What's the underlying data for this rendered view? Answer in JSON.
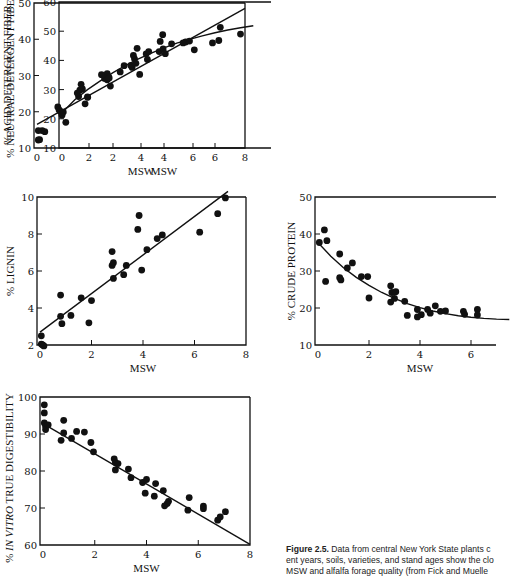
{
  "chart_data": [
    {
      "id": "adf",
      "type": "scatter",
      "title": "",
      "xlabel": "MSW",
      "ylabel": "% ACID DETERGENT FIBER",
      "xlim": [
        0,
        8
      ],
      "ylim": [
        10,
        50
      ],
      "xticks": [
        0,
        2,
        4,
        6,
        8
      ],
      "yticks": [
        10,
        20,
        30,
        40,
        50
      ],
      "fit": {
        "type": "linear",
        "points": [
          [
            0,
            16.5
          ],
          [
            8,
            48.5
          ]
        ]
      },
      "points": [
        [
          0.05,
          12.2
        ],
        [
          0.1,
          12.3
        ],
        [
          0.05,
          14.8
        ],
        [
          0.2,
          14.8
        ],
        [
          0.3,
          14.5
        ],
        [
          0.8,
          21.3
        ],
        [
          0.85,
          20.5
        ],
        [
          0.9,
          20.1
        ],
        [
          1.6,
          24.2
        ],
        [
          1.85,
          22.2
        ],
        [
          1.95,
          24.0
        ],
        [
          2.6,
          29.2
        ],
        [
          2.7,
          30.5
        ],
        [
          2.7,
          28.8
        ],
        [
          2.75,
          29.6
        ],
        [
          3.2,
          31.0
        ],
        [
          3.35,
          32.7
        ],
        [
          3.75,
          34.6
        ],
        [
          3.85,
          37.5
        ],
        [
          3.95,
          30.3
        ],
        [
          4.2,
          36.0
        ],
        [
          4.7,
          36.6
        ],
        [
          4.85,
          37.3
        ],
        [
          6.05,
          37.1
        ],
        [
          6.75,
          39.0
        ],
        [
          7.05,
          43.3
        ]
      ]
    },
    {
      "id": "ndf",
      "type": "scatter",
      "title": "",
      "xlabel": "MSW",
      "ylabel": "% NEUTRAL-DETERGENT FIBER",
      "xlim": [
        0,
        8
      ],
      "ylim": [
        10,
        60
      ],
      "xticks": [
        0,
        2,
        4,
        6
      ],
      "yticks": [
        10,
        20,
        30,
        40,
        50,
        60
      ],
      "fit": {
        "type": "curve",
        "points": [
          [
            0.05,
            22.5
          ],
          [
            0.5,
            26.5
          ],
          [
            1,
            30
          ],
          [
            1.5,
            33
          ],
          [
            2,
            35.8
          ],
          [
            2.5,
            38.3
          ],
          [
            3,
            40.5
          ],
          [
            3.5,
            42.5
          ],
          [
            4,
            44.3
          ],
          [
            4.5,
            45.9
          ],
          [
            5,
            47.2
          ],
          [
            5.5,
            48.4
          ],
          [
            6,
            49.5
          ],
          [
            6.5,
            50.4
          ],
          [
            7,
            51.2
          ],
          [
            7.5,
            51.9
          ]
        ]
      },
      "points": [
        [
          0,
          21.2
        ],
        [
          0.05,
          22.3
        ],
        [
          0.15,
          18.8
        ],
        [
          0.6,
          28.8
        ],
        [
          0.7,
          29.8
        ],
        [
          0.75,
          31.8
        ],
        [
          0.8,
          30.2
        ],
        [
          1.0,
          27.5
        ],
        [
          1.55,
          35.1
        ],
        [
          1.85,
          34.0
        ],
        [
          1.9,
          31.2
        ],
        [
          2.7,
          38.3
        ],
        [
          2.75,
          37.6
        ],
        [
          2.8,
          41.7
        ],
        [
          2.9,
          39.0
        ],
        [
          3.35,
          40.3
        ],
        [
          3.4,
          43.0
        ],
        [
          3.85,
          46.5
        ],
        [
          3.95,
          48.8
        ],
        [
          4.05,
          42.3
        ],
        [
          4.3,
          45.7
        ],
        [
          4.75,
          46.0
        ],
        [
          4.85,
          46.3
        ],
        [
          5.0,
          46.6
        ],
        [
          6.15,
          46.8
        ],
        [
          7.0,
          49.0
        ]
      ]
    },
    {
      "id": "lignin",
      "type": "scatter",
      "title": "",
      "xlabel": "MSW",
      "ylabel": "% LIGNIN",
      "xlim": [
        0,
        8
      ],
      "ylim": [
        2,
        10
      ],
      "xticks": [
        0,
        2,
        4,
        6,
        8
      ],
      "yticks": [
        2,
        4,
        6,
        8,
        10
      ],
      "fit": {
        "type": "linear",
        "points": [
          [
            0,
            2.7
          ],
          [
            7.3,
            10.3
          ]
        ]
      },
      "points": [
        [
          0.05,
          2.5
        ],
        [
          0.05,
          2.05
        ],
        [
          0.1,
          2.0
        ],
        [
          0.15,
          1.95
        ],
        [
          0.8,
          4.7
        ],
        [
          0.8,
          3.55
        ],
        [
          0.85,
          3.15
        ],
        [
          1.2,
          3.6
        ],
        [
          1.6,
          4.55
        ],
        [
          1.9,
          3.2
        ],
        [
          2.0,
          4.4
        ],
        [
          2.8,
          7.05
        ],
        [
          2.8,
          6.3
        ],
        [
          2.85,
          6.45
        ],
        [
          2.85,
          5.6
        ],
        [
          3.25,
          5.8
        ],
        [
          3.35,
          6.3
        ],
        [
          3.8,
          8.25
        ],
        [
          3.85,
          9.0
        ],
        [
          3.95,
          6.05
        ],
        [
          4.15,
          7.15
        ],
        [
          4.55,
          7.75
        ],
        [
          4.75,
          7.95
        ],
        [
          6.2,
          8.1
        ],
        [
          6.9,
          9.1
        ],
        [
          7.2,
          9.95
        ]
      ]
    },
    {
      "id": "cp",
      "type": "scatter",
      "title": "",
      "xlabel": "MSW",
      "ylabel": "% CRUDE PROTEIN",
      "xlim": [
        0,
        8
      ],
      "ylim": [
        10,
        50
      ],
      "xticks": [
        0,
        2,
        4,
        6
      ],
      "yticks": [
        10,
        20,
        30,
        40,
        50
      ],
      "fit": {
        "type": "curve",
        "points": [
          [
            0.05,
            37.3
          ],
          [
            0.5,
            34.0
          ],
          [
            1,
            30.9
          ],
          [
            1.5,
            28.3
          ],
          [
            2,
            26.1
          ],
          [
            2.5,
            24.2
          ],
          [
            3,
            22.6
          ],
          [
            3.5,
            21.2
          ],
          [
            4,
            20.1
          ],
          [
            4.5,
            19.2
          ],
          [
            5,
            18.5
          ],
          [
            5.5,
            17.9
          ],
          [
            6,
            17.5
          ],
          [
            6.5,
            17.2
          ],
          [
            7,
            17.0
          ],
          [
            7.5,
            16.9
          ]
        ]
      },
      "points": [
        [
          0.05,
          37.7
        ],
        [
          0.25,
          41.1
        ],
        [
          0.35,
          38.2
        ],
        [
          0.3,
          27.2
        ],
        [
          0.85,
          34.6
        ],
        [
          0.85,
          28.2
        ],
        [
          0.9,
          27.6
        ],
        [
          1.15,
          30.8
        ],
        [
          1.35,
          32.2
        ],
        [
          1.7,
          28.5
        ],
        [
          1.95,
          28.5
        ],
        [
          2.0,
          22.7
        ],
        [
          2.85,
          26.0
        ],
        [
          2.85,
          21.6
        ],
        [
          2.9,
          24.2
        ],
        [
          3.0,
          22.6
        ],
        [
          3.05,
          24.4
        ],
        [
          3.4,
          21.8
        ],
        [
          3.5,
          18.0
        ],
        [
          3.9,
          19.6
        ],
        [
          3.9,
          17.6
        ],
        [
          4.05,
          18.2
        ],
        [
          4.3,
          19.6
        ],
        [
          4.4,
          18.6
        ],
        [
          4.6,
          20.6
        ],
        [
          4.8,
          19.1
        ],
        [
          5.0,
          19.2
        ],
        [
          5.7,
          19.1
        ],
        [
          5.75,
          18.3
        ],
        [
          6.25,
          19.6
        ],
        [
          6.25,
          18.1
        ]
      ]
    },
    {
      "id": "ivtd",
      "type": "scatter",
      "title": "",
      "xlabel": "MSW",
      "ylabel": "% IN VITRO TRUE DIGESTIBILITY",
      "xlim": [
        0,
        8
      ],
      "ylim": [
        60,
        100
      ],
      "xticks": [
        0,
        2,
        4,
        6,
        8
      ],
      "yticks": [
        60,
        70,
        80,
        90,
        100
      ],
      "fit": {
        "type": "linear",
        "points": [
          [
            0,
            92.8
          ],
          [
            8,
            60.2
          ]
        ]
      },
      "points": [
        [
          0.05,
          97.9
        ],
        [
          0.05,
          95.7
        ],
        [
          0.05,
          93.0
        ],
        [
          0.1,
          92.0
        ],
        [
          0.1,
          91.2
        ],
        [
          0.2,
          92.5
        ],
        [
          0.7,
          88.3
        ],
        [
          0.8,
          93.7
        ],
        [
          0.8,
          90.3
        ],
        [
          1.1,
          88.8
        ],
        [
          1.3,
          90.7
        ],
        [
          1.6,
          90.5
        ],
        [
          1.85,
          87.7
        ],
        [
          1.95,
          85.2
        ],
        [
          2.75,
          83.3
        ],
        [
          2.8,
          82.3
        ],
        [
          2.8,
          80.3
        ],
        [
          2.9,
          82.0
        ],
        [
          3.3,
          80.5
        ],
        [
          3.4,
          78.2
        ],
        [
          3.85,
          76.9
        ],
        [
          3.95,
          74.0
        ],
        [
          4.0,
          77.7
        ],
        [
          4.3,
          73.2
        ],
        [
          4.35,
          76.6
        ],
        [
          4.65,
          74.7
        ],
        [
          4.7,
          70.6
        ],
        [
          4.8,
          71.2
        ],
        [
          4.85,
          71.8
        ],
        [
          5.6,
          69.4
        ],
        [
          5.65,
          72.8
        ],
        [
          6.2,
          70.5
        ],
        [
          6.2,
          69.8
        ],
        [
          6.75,
          66.7
        ],
        [
          6.85,
          67.6
        ],
        [
          7.05,
          69.0
        ]
      ]
    }
  ],
  "caption": {
    "label": "Figure 2.5.",
    "line1": " Data from central New York State plants c",
    "line2": "ent years, soils, varieties, and stand ages show the clo",
    "line3": "MSW and alfalfa forage quality (from Fick and Muelle"
  },
  "colors": {
    "ink": "#111111",
    "background": "#ffffff"
  }
}
